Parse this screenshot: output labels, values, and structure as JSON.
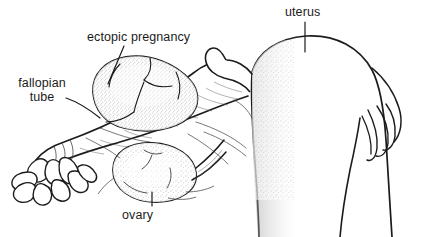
{
  "figure": {
    "type": "line-drawing",
    "background_color": "#ffffff",
    "ink_color": "#1b1b1b",
    "stipple_color": "#5a5a5a"
  },
  "labels": {
    "ectopic_pregnancy": "ectopic pregnancy",
    "uterus": "uterus",
    "ovary": "ovary",
    "fallopian_line1": "fallopian",
    "fallopian_line2": "tube"
  }
}
